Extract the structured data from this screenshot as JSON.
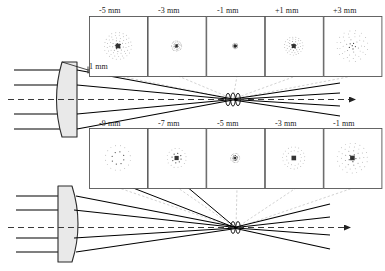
{
  "figure": {
    "type": "optical-ray-diagram",
    "axis_arrow": "optical-axis-arrow"
  },
  "aperture": {
    "label": "1 mm"
  },
  "rows": [
    {
      "id": "top",
      "name": "top-spot-row",
      "lens_orientation": "convex-left",
      "boxes": [
        {
          "label": "-5 mm",
          "pattern": "filled-disc",
          "radius": 13.5,
          "density": "high",
          "rings": 5
        },
        {
          "label": "-3 mm",
          "pattern": "filled-disc",
          "radius": 5.0,
          "density": "high",
          "rings": 3
        },
        {
          "label": "-1 mm",
          "pattern": "filled-disc",
          "radius": 2.6,
          "density": "high",
          "rings": 2
        },
        {
          "label": "+1 mm",
          "pattern": "ringed-disc",
          "radius": 9.0,
          "density": "medium",
          "rings": 4
        },
        {
          "label": "+3 mm",
          "pattern": "sparse-disc",
          "radius": 15.5,
          "density": "low",
          "rings": 5
        }
      ]
    },
    {
      "id": "bottom",
      "name": "bottom-spot-row",
      "lens_orientation": "convex-right",
      "boxes": [
        {
          "label": "-9 mm",
          "pattern": "annulus",
          "radius": 12.5,
          "density": "low",
          "rings": 2
        },
        {
          "label": "-7 mm",
          "pattern": "annulus-core",
          "radius": 9.5,
          "density": "low",
          "rings": 2
        },
        {
          "label": "-5 mm",
          "pattern": "small-core",
          "radius": 4.5,
          "density": "medium",
          "rings": 2
        },
        {
          "label": "-3 mm",
          "pattern": "annulus-core",
          "radius": 11.0,
          "density": "medium",
          "rings": 3
        },
        {
          "label": "-1 mm",
          "pattern": "ringed-core",
          "radius": 15.0,
          "density": "medium",
          "rings": 4
        }
      ]
    }
  ],
  "colors": {
    "ray": "#000000",
    "lens_fill": "#e8e8e8",
    "lens_stroke": "#333333",
    "box_stroke": "#555555",
    "leader": "#b9b9b9",
    "axis": "#444444",
    "dot": "#6e6e6e"
  }
}
